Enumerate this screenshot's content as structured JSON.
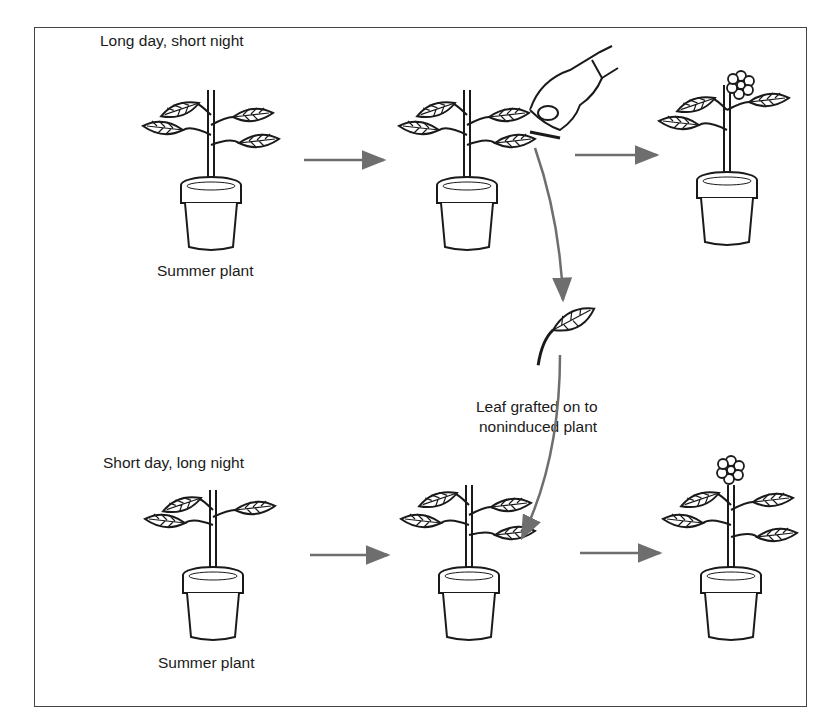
{
  "diagram": {
    "title": "",
    "rows": [
      {
        "condition_label": "Long day, short night",
        "plant_label": "Summer plant",
        "stages": [
          "vegetative plant",
          "leaf being cut",
          "flowering plant"
        ]
      },
      {
        "condition_label": "Short day, long night",
        "plant_label": "Summer plant",
        "stages": [
          "vegetative plant",
          "plant receiving grafted leaf",
          "flowering plant"
        ]
      }
    ],
    "graft_label_line1": "Leaf grafted on to",
    "graft_label_line2": "noninduced plant",
    "colors": {
      "arrow": "#6e6e6e",
      "line": "#1a1a1a",
      "frame": "#444444"
    }
  }
}
